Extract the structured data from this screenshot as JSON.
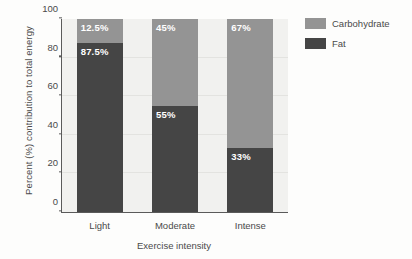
{
  "chart_data": {
    "type": "bar",
    "subtype": "stacked-100-percent",
    "title": "",
    "xlabel": "Exercise intensity",
    "ylabel": "Percent (%) contribution to total energy",
    "categories": [
      "Light",
      "Moderate",
      "Intense"
    ],
    "ylim": [
      0,
      100
    ],
    "yticks": [
      0,
      20,
      40,
      60,
      80,
      100
    ],
    "grid": true,
    "legend_position": "right",
    "series": [
      {
        "name": "Carbohydrate",
        "color": "#949494",
        "values": [
          12.5,
          45,
          67
        ],
        "labels": [
          "12.5%",
          "45%",
          "67%"
        ]
      },
      {
        "name": "Fat",
        "color": "#454545",
        "values": [
          87.5,
          55,
          33
        ],
        "labels": [
          "87.5%",
          "55%",
          "33%"
        ]
      }
    ]
  },
  "axis": {
    "ytick_labels": [
      "0",
      "20",
      "40",
      "60",
      "80",
      "100"
    ],
    "xtick_labels": [
      "Light",
      "Moderate",
      "Intense"
    ],
    "xlabel": "Exercise intensity",
    "ylabel": "Percent (%) contribution to total energy"
  },
  "legend": {
    "items": [
      {
        "label": "Carbohydrate",
        "color": "#949494"
      },
      {
        "label": "Fat",
        "color": "#454545"
      }
    ]
  },
  "colors": {
    "carbohydrate": "#949494",
    "fat": "#454545",
    "plot_background": "#f1f1ef",
    "axis": "#5a5a5a",
    "text": "#4a4a4a",
    "label_text": "#ffffff"
  }
}
